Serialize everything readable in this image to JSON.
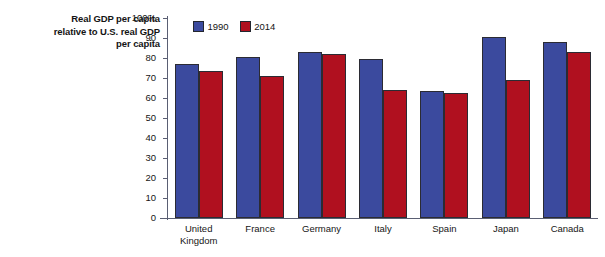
{
  "chart_data": {
    "type": "bar",
    "title": "Real GDP per capita relative to U.S. real GDP per capita",
    "title_lines": [
      "Real GDP per capita",
      "relative to U.S. real GDP",
      "per capita"
    ],
    "xlabel": "",
    "ylabel": "",
    "ylim": [
      0,
      100
    ],
    "yticks": [
      100,
      90,
      80,
      70,
      60,
      50,
      40,
      30,
      20,
      10,
      0
    ],
    "ytick_labels": [
      "100%",
      "90",
      "80",
      "70",
      "60",
      "50",
      "40",
      "30",
      "20",
      "10",
      "0"
    ],
    "grid": false,
    "legend_position": "top-left-inside",
    "categories": [
      "United Kingdom",
      "France",
      "Germany",
      "Italy",
      "Spain",
      "Japan",
      "Canada"
    ],
    "category_lines": [
      [
        "United",
        "Kingdom"
      ],
      [
        "France"
      ],
      [
        "Germany"
      ],
      [
        "Italy"
      ],
      [
        "Spain"
      ],
      [
        "Japan"
      ],
      [
        "Canada"
      ]
    ],
    "series": [
      {
        "name": "1990",
        "color": "#3b4a9e",
        "values": [
          77,
          80.5,
          83,
          79.5,
          63.5,
          90.5,
          88
        ]
      },
      {
        "name": "2014",
        "color": "#b0101f",
        "values": [
          73.5,
          71,
          82,
          64,
          62.5,
          69,
          83
        ]
      }
    ]
  },
  "axis": {
    "line_color": "#5a5f73"
  }
}
